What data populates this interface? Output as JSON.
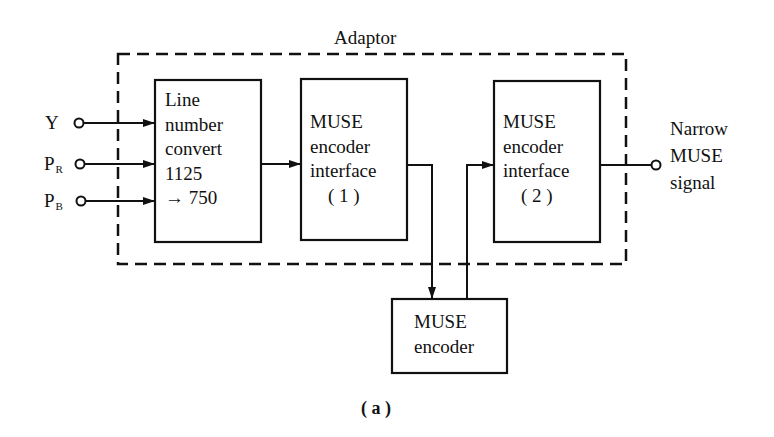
{
  "diagram": {
    "adaptor_label": "Adaptor",
    "inputs": [
      {
        "main": "Y",
        "sub": ""
      },
      {
        "main": "P",
        "sub": "R"
      },
      {
        "main": "P",
        "sub": "B"
      }
    ],
    "blocks": {
      "line_number_convert": [
        "Line",
        "number",
        "convert",
        "1125",
        "→ 750"
      ],
      "muse_interface_1": [
        "MUSE",
        "encoder",
        "interface",
        "( 1 )"
      ],
      "muse_interface_2": [
        "MUSE",
        "encoder",
        "interface",
        "( 2 )"
      ],
      "muse_encoder": [
        "MUSE",
        "encoder"
      ]
    },
    "output_label": [
      "Narrow",
      "MUSE",
      "signal"
    ],
    "caption": "( a )"
  }
}
